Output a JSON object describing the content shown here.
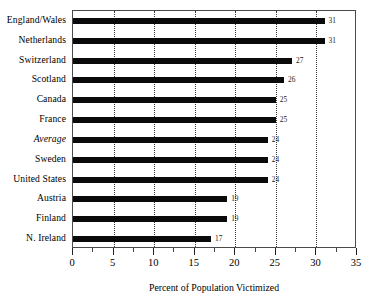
{
  "chart_data": {
    "type": "bar",
    "orientation": "horizontal",
    "title": "",
    "xlabel": "Percent of Population Victimized",
    "ylabel": "",
    "xlim": [
      0,
      35
    ],
    "xticks": [
      0,
      5,
      10,
      15,
      20,
      25,
      30,
      35
    ],
    "xtick_labels": [
      "0",
      "5",
      "10",
      "15",
      "20",
      "25",
      "30",
      "35"
    ],
    "minor_tick_step": 2.5,
    "grid": "vertical dotted gridlines at 5,10,15,20,25,30",
    "gridline_values": [
      5,
      10,
      15,
      20,
      25,
      30
    ],
    "legend": "none",
    "bar_color": "#0a0a0a",
    "categories": [
      "England/Wales",
      "Netherlands",
      "Switzerland",
      "Scotland",
      "Canada",
      "France",
      "Average",
      "Sweden",
      "United States",
      "Austria",
      "Finland",
      "N. Ireland"
    ],
    "values": [
      31,
      31,
      27,
      26,
      25,
      25,
      24,
      24,
      24,
      19,
      19,
      17
    ],
    "value_labels": [
      "31",
      "31",
      "27",
      "26",
      "25",
      "25",
      "24",
      "24",
      "24",
      "19",
      "19",
      "17"
    ],
    "emphasis": {
      "italic_categories": [
        "Average"
      ]
    }
  }
}
